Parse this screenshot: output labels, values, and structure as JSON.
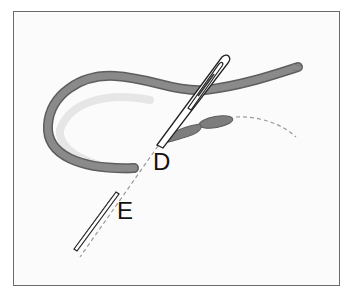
{
  "figure": {
    "labels": {
      "d": "D",
      "e": "E"
    },
    "colors": {
      "thread": "#7d7d7d",
      "thread_dark": "#5a5a5a",
      "needle": "#2a2a2a",
      "dashed_path": "#9a9a9a",
      "frame": "#6a6a6a"
    }
  }
}
